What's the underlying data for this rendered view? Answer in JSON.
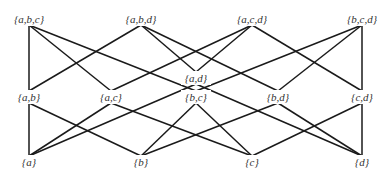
{
  "diagram": {
    "type": "hasse",
    "title": "",
    "colors": {
      "edge": "#1a1a1a",
      "label": "#333333",
      "background": "#ffffff"
    },
    "nodes": [
      {
        "id": "abc",
        "label": "{a,b,c}",
        "x": 29,
        "y": 19
      },
      {
        "id": "abd",
        "label": "{a,b,d}",
        "x": 141,
        "y": 19
      },
      {
        "id": "acd",
        "label": "{a,c,d}",
        "x": 252,
        "y": 19
      },
      {
        "id": "bcd",
        "label": "{b,c,d}",
        "x": 362,
        "y": 19
      },
      {
        "id": "ad",
        "label": "{a,d}",
        "x": 196,
        "y": 78
      },
      {
        "id": "ab",
        "label": "{a,b}",
        "x": 29,
        "y": 97
      },
      {
        "id": "ac",
        "label": "{a,c}",
        "x": 111,
        "y": 97
      },
      {
        "id": "bc",
        "label": "{b,c}",
        "x": 196,
        "y": 97
      },
      {
        "id": "bd",
        "label": "{b,d}",
        "x": 278,
        "y": 97
      },
      {
        "id": "cd",
        "label": "{c,d}",
        "x": 362,
        "y": 97
      },
      {
        "id": "a",
        "label": "{a}",
        "x": 29,
        "y": 162
      },
      {
        "id": "b",
        "label": "{b}",
        "x": 141,
        "y": 162
      },
      {
        "id": "c",
        "label": "{c}",
        "x": 252,
        "y": 162
      },
      {
        "id": "d",
        "label": "{d}",
        "x": 362,
        "y": 162
      }
    ],
    "edges": [
      [
        "abc",
        "ab"
      ],
      [
        "abc",
        "ac"
      ],
      [
        "abc",
        "bc"
      ],
      [
        "abd",
        "ab"
      ],
      [
        "abd",
        "ad"
      ],
      [
        "abd",
        "bd"
      ],
      [
        "acd",
        "ac"
      ],
      [
        "acd",
        "ad"
      ],
      [
        "acd",
        "cd"
      ],
      [
        "bcd",
        "bc"
      ],
      [
        "bcd",
        "bd"
      ],
      [
        "bcd",
        "cd"
      ],
      [
        "ab",
        "a"
      ],
      [
        "ab",
        "b"
      ],
      [
        "ac",
        "a"
      ],
      [
        "ac",
        "c"
      ],
      [
        "ad",
        "a"
      ],
      [
        "ad",
        "d"
      ],
      [
        "bc",
        "b"
      ],
      [
        "bc",
        "c"
      ],
      [
        "bd",
        "b"
      ],
      [
        "bd",
        "d"
      ],
      [
        "cd",
        "c"
      ],
      [
        "cd",
        "d"
      ]
    ]
  }
}
